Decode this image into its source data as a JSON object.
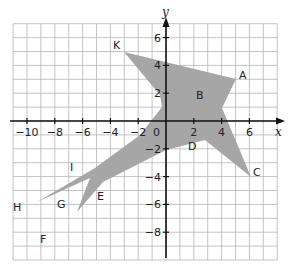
{
  "diagram": {
    "axes": {
      "x_label": "x",
      "y_label": "y",
      "origin_label": "0",
      "x_ticks": [
        "−10",
        "−8",
        "−6",
        "−4",
        "−2",
        "2",
        "4",
        "6"
      ],
      "y_ticks": [
        "6",
        "4",
        "2",
        "−2",
        "−4",
        "−6",
        "−8"
      ],
      "x_range": [
        -11,
        8
      ],
      "y_range": [
        -10,
        7
      ]
    },
    "shape": {
      "fill_color": "#a6a6a6",
      "description": "shaded star-like polygon"
    },
    "points": [
      {
        "label": "K",
        "x": -3,
        "y": 5
      },
      {
        "label": "A",
        "x": 5,
        "y": 3
      },
      {
        "label": "B",
        "x": 2,
        "y": 2
      },
      {
        "label": "C",
        "x": 6,
        "y": -4
      },
      {
        "label": "D",
        "x": 2,
        "y": -1.5
      },
      {
        "label": "E",
        "x": -4.5,
        "y": -4.5
      },
      {
        "label": "F",
        "x": -7.5,
        "y": -8
      },
      {
        "label": "G",
        "x": -6.5,
        "y": -5.5
      },
      {
        "label": "H",
        "x": -11,
        "y": -6
      },
      {
        "label": "I",
        "x": -6.5,
        "y": -3.5
      }
    ],
    "grid_color": "#b5b5b5",
    "axis_color": "#111111"
  }
}
